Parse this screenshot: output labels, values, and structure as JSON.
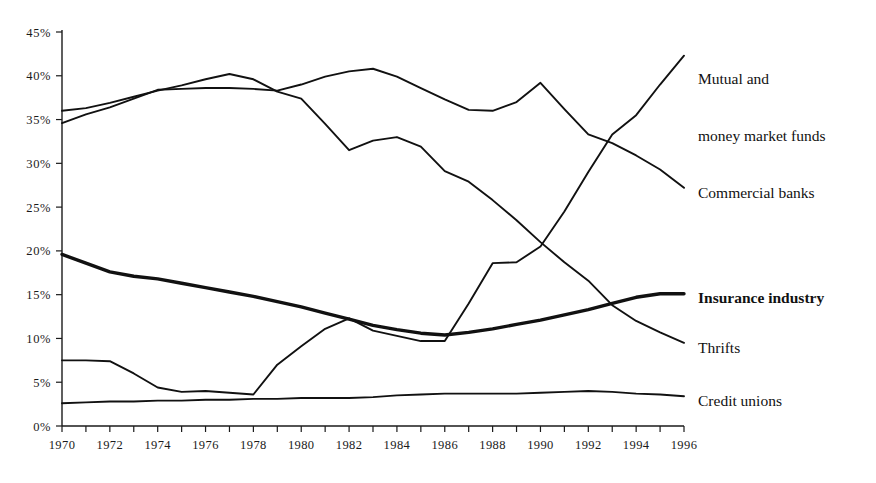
{
  "chart_data": {
    "type": "line",
    "title": "",
    "subtitle": "",
    "xlabel": "",
    "ylabel": "",
    "xlim": [
      1970,
      1996
    ],
    "ylim": [
      0,
      45
    ],
    "grid": false,
    "legend_position": "right-of-plot-line-end",
    "x": [
      1970,
      1971,
      1972,
      1973,
      1974,
      1975,
      1976,
      1977,
      1978,
      1979,
      1980,
      1981,
      1982,
      1983,
      1984,
      1985,
      1986,
      1987,
      1988,
      1989,
      1990,
      1991,
      1992,
      1993,
      1994,
      1995,
      1996
    ],
    "y_ticks": [
      "0%",
      "5%",
      "10%",
      "15%",
      "20%",
      "25%",
      "30%",
      "35%",
      "40%",
      "45%"
    ],
    "y_tick_values": [
      0,
      5,
      10,
      15,
      20,
      25,
      30,
      35,
      40,
      45
    ],
    "x_tick_labels": [
      "1970",
      "1972",
      "1974",
      "1976",
      "1978",
      "1980",
      "1982",
      "1984",
      "1986",
      "1988",
      "1990",
      "1992",
      "1994",
      "1996"
    ],
    "x_tick_label_values": [
      1970,
      1972,
      1974,
      1976,
      1978,
      1980,
      1982,
      1984,
      1986,
      1988,
      1990,
      1992,
      1994,
      1996
    ],
    "series": [
      {
        "name": "Commercial banks",
        "emphasis": "normal",
        "values": [
          34.6,
          35.6,
          36.4,
          37.4,
          38.4,
          38.5,
          38.6,
          38.6,
          38.5,
          38.3,
          39.0,
          39.9,
          40.5,
          40.8,
          39.9,
          38.6,
          37.3,
          36.1,
          36.0,
          37.0,
          39.2,
          36.2,
          33.3,
          32.3,
          30.9,
          29.3,
          27.2
        ]
      },
      {
        "name": "Thrifts",
        "emphasis": "normal",
        "values": [
          36.0,
          36.3,
          36.9,
          37.6,
          38.3,
          38.9,
          39.6,
          40.2,
          39.6,
          38.2,
          37.4,
          34.5,
          31.5,
          32.6,
          33.0,
          31.9,
          29.1,
          27.9,
          25.8,
          23.5,
          21.0,
          18.7,
          16.6,
          13.8,
          12.0,
          10.7,
          9.5
        ]
      },
      {
        "name": "Insurance industry",
        "emphasis": "bold",
        "values": [
          19.6,
          18.6,
          17.6,
          17.1,
          16.8,
          16.3,
          15.8,
          15.3,
          14.8,
          14.2,
          13.6,
          12.9,
          12.2,
          11.5,
          11.0,
          10.6,
          10.4,
          10.7,
          11.1,
          11.6,
          12.1,
          12.7,
          13.3,
          14.0,
          14.7,
          15.1,
          15.1
        ]
      },
      {
        "name": "Mutual and money market funds",
        "emphasis": "normal",
        "values": [
          7.5,
          7.5,
          7.4,
          6.0,
          4.4,
          3.9,
          4.0,
          3.8,
          3.6,
          7.0,
          9.1,
          11.1,
          12.3,
          10.9,
          10.3,
          9.7,
          9.7,
          14.0,
          18.6,
          18.7,
          20.5,
          24.5,
          29.0,
          33.3,
          35.5,
          39.0,
          42.3
        ]
      },
      {
        "name": "Credit unions",
        "emphasis": "normal",
        "values": [
          2.6,
          2.7,
          2.8,
          2.8,
          2.9,
          2.9,
          3.0,
          3.0,
          3.1,
          3.1,
          3.2,
          3.2,
          3.2,
          3.3,
          3.5,
          3.6,
          3.7,
          3.7,
          3.7,
          3.7,
          3.8,
          3.9,
          4.0,
          3.9,
          3.7,
          3.6,
          3.4
        ]
      }
    ],
    "annotations": [
      {
        "text_line1": "Mutual and",
        "text_line2": "money market funds",
        "anchor_series": "Mutual and money market funds"
      },
      {
        "text_line1": "Commercial banks",
        "text_line2": "",
        "anchor_series": "Commercial banks"
      },
      {
        "text_line1": "Insurance industry",
        "text_line2": "",
        "anchor_series": "Insurance industry"
      },
      {
        "text_line1": "Thrifts",
        "text_line2": "",
        "anchor_series": "Thrifts"
      },
      {
        "text_line1": "Credit unions",
        "text_line2": "",
        "anchor_series": "Credit unions"
      }
    ]
  },
  "legend": {
    "mutual_line1": "Mutual and",
    "mutual_line2": "money market funds",
    "commercial_banks": "Commercial banks",
    "insurance_industry": "Insurance industry",
    "thrifts": "Thrifts",
    "credit_unions": "Credit unions"
  },
  "colors": {
    "line": "#111111",
    "axis": "#1a1a1a",
    "background": "#ffffff"
  }
}
